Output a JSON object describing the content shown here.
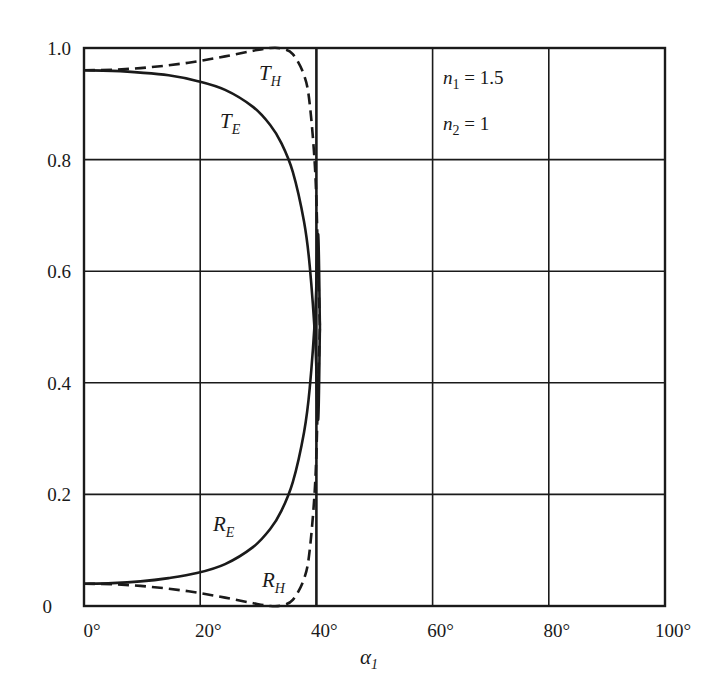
{
  "chart_data": {
    "type": "line",
    "title": "",
    "xlabel": "α₁",
    "ylabel": "",
    "xlim": [
      0,
      100
    ],
    "ylim": [
      0,
      1.0
    ],
    "grid": true,
    "x_ticks": [
      "0°",
      "20°",
      "40°",
      "60°",
      "80°",
      "100°"
    ],
    "y_ticks": [
      "0",
      "0.2",
      "0.4",
      "0.6",
      "0.8",
      "1.0"
    ],
    "annotations": [
      {
        "text": "n₁ = 1.5",
        "base": "n",
        "sub": "1",
        "rest": " = 1.5"
      },
      {
        "text": "n₂ = 1",
        "base": "n",
        "sub": "2",
        "rest": " = 1"
      }
    ],
    "critical_angle_deg": 41.8,
    "x": [
      0,
      5,
      10,
      15,
      20,
      25,
      30,
      33,
      35,
      37,
      39,
      40,
      41,
      41.5,
      41.8
    ],
    "series": [
      {
        "name": "T_E",
        "label_base": "T",
        "label_sub": "E",
        "style": "solid",
        "values": [
          0.96,
          0.959,
          0.956,
          0.951,
          0.941,
          0.925,
          0.894,
          0.862,
          0.829,
          0.778,
          0.688,
          0.61,
          0.469,
          0.334,
          0.0
        ]
      },
      {
        "name": "T_H",
        "label_base": "T",
        "label_sub": "H",
        "style": "dashed",
        "values": [
          0.96,
          0.961,
          0.964,
          0.969,
          0.976,
          0.985,
          0.995,
          1.0,
          0.999,
          0.989,
          0.951,
          0.9,
          0.772,
          0.604,
          0.0
        ]
      },
      {
        "name": "R_E",
        "label_base": "R",
        "label_sub": "E",
        "style": "solid",
        "values": [
          0.04,
          0.041,
          0.044,
          0.05,
          0.059,
          0.075,
          0.106,
          0.138,
          0.171,
          0.222,
          0.312,
          0.39,
          0.531,
          0.666,
          1.0
        ]
      },
      {
        "name": "R_H",
        "label_base": "R",
        "label_sub": "H",
        "style": "dashed",
        "values": [
          0.04,
          0.039,
          0.036,
          0.031,
          0.024,
          0.015,
          0.005,
          0.0,
          0.001,
          0.011,
          0.049,
          0.1,
          0.228,
          0.396,
          1.0
        ]
      }
    ],
    "legend_position": "inline-labels"
  }
}
